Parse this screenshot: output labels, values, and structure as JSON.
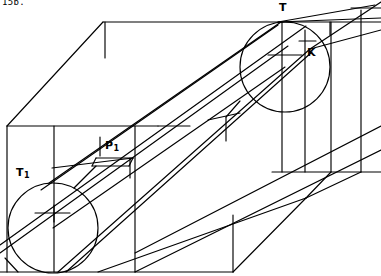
{
  "figure": {
    "kind": "technical-line-drawing",
    "header_text": "15b.",
    "stroke_color": "#000000",
    "background_color": "#ffffff",
    "labels": [
      {
        "id": "T",
        "base": "T",
        "sub": "",
        "x": 279,
        "y": 2
      },
      {
        "id": "T1",
        "base": "T",
        "sub": "1",
        "x": 16,
        "y": 167
      },
      {
        "id": "K",
        "base": "K",
        "sub": "",
        "x": 307,
        "y": 47
      },
      {
        "id": "P1",
        "base": "P",
        "sub": "1",
        "x": 105,
        "y": 140
      }
    ],
    "circles": [
      {
        "name": "circle-T1",
        "cx": 53,
        "cy": 228,
        "r": 45
      },
      {
        "name": "circle-T",
        "cx": 285,
        "cy": 67,
        "r": 45
      }
    ]
  }
}
